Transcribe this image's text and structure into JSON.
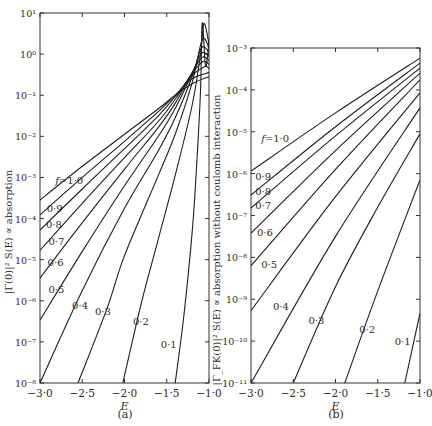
{
  "figure": {
    "caption_a": "(a)",
    "caption_b": "(b)"
  },
  "chart_data": [
    {
      "type": "line",
      "panel": "(a)",
      "title": "",
      "xlabel": "E",
      "ylabel": "|Γ(0)|² S(E) ∝ absorption",
      "yscale": "log",
      "xlim": [
        -3.0,
        -1.0
      ],
      "ylim_log10": [
        -8,
        1
      ],
      "xticks": [
        "−3·0",
        "−2·5",
        "−2·0",
        "−1·5",
        "−1·0"
      ],
      "xtick_values": [
        -3.0,
        -2.5,
        -2.0,
        -1.5,
        -1.0
      ],
      "yticks": [
        "10⁻⁸",
        "10⁻⁷",
        "10⁻⁶",
        "10⁻⁵",
        "10⁻⁴",
        "10⁻³",
        "10⁻²",
        "10⁻¹",
        "10⁰",
        "10¹"
      ],
      "ytick_exponents": [
        -8,
        -7,
        -6,
        -5,
        -4,
        -3,
        -2,
        -1,
        0,
        1
      ],
      "grid": false,
      "legend": "inline labels",
      "series": [
        {
          "name": "f=1·0",
          "label": "f=1·0",
          "points_log10": [
            [
              -3.0,
              -3.55
            ],
            [
              -2.5,
              -2.73
            ],
            [
              -2.0,
              -1.95
            ],
            [
              -1.6,
              -1.33
            ],
            [
              -1.4,
              -1.0
            ],
            [
              -1.2,
              -0.72
            ],
            [
              -1.0,
              -0.55
            ]
          ],
          "label_pos": [
            -2.82,
            -3.15
          ]
        },
        {
          "name": "f=0·9",
          "label": "0·9",
          "points_log10": [
            [
              -3.0,
              -3.91
            ],
            [
              -2.5,
              -3.0
            ],
            [
              -2.0,
              -2.12
            ],
            [
              -1.6,
              -1.4
            ],
            [
              -1.4,
              -1.0
            ],
            [
              -1.2,
              -0.6
            ],
            [
              -1.0,
              -0.45
            ]
          ],
          "label_pos": [
            -2.92,
            -3.85
          ]
        },
        {
          "name": "f=0·8",
          "label": "0·8",
          "points_log10": [
            [
              -3.0,
              -4.28
            ],
            [
              -2.5,
              -3.28
            ],
            [
              -2.0,
              -2.3
            ],
            [
              -1.6,
              -1.5
            ],
            [
              -1.4,
              -1.03
            ],
            [
              -1.2,
              -0.52
            ],
            [
              -1.05,
              -0.3
            ],
            [
              -1.0,
              -0.35
            ]
          ],
          "label_pos": [
            -2.93,
            -4.22
          ]
        },
        {
          "name": "f=0·7",
          "label": "0·7",
          "points_log10": [
            [
              -3.0,
              -4.77
            ],
            [
              -2.5,
              -3.63
            ],
            [
              -2.0,
              -2.52
            ],
            [
              -1.6,
              -1.64
            ],
            [
              -1.4,
              -1.1
            ],
            [
              -1.2,
              -0.47
            ],
            [
              -1.07,
              -0.18
            ],
            [
              -1.0,
              -0.25
            ]
          ],
          "label_pos": [
            -2.9,
            -4.65
          ]
        },
        {
          "name": "f=0·6",
          "label": "0·6",
          "points_log10": [
            [
              -3.0,
              -5.45
            ],
            [
              -2.5,
              -4.1
            ],
            [
              -2.0,
              -2.8
            ],
            [
              -1.6,
              -1.78
            ],
            [
              -1.4,
              -1.2
            ],
            [
              -1.2,
              -0.45
            ],
            [
              -1.08,
              -0.08
            ],
            [
              -1.0,
              -0.15
            ]
          ],
          "label_pos": [
            -2.91,
            -5.15
          ]
        },
        {
          "name": "f=0·5",
          "label": "0·5",
          "points_log10": [
            [
              -3.0,
              -6.47
            ],
            [
              -2.5,
              -4.8
            ],
            [
              -2.0,
              -3.2
            ],
            [
              -1.6,
              -2.0
            ],
            [
              -1.4,
              -1.32
            ],
            [
              -1.2,
              -0.48
            ],
            [
              -1.09,
              0.02
            ],
            [
              -1.0,
              -0.05
            ]
          ],
          "label_pos": [
            -2.9,
            -5.8
          ]
        },
        {
          "name": "f=0·4",
          "label": "0·4",
          "points_log10": [
            [
              -3.0,
              -8.0
            ],
            [
              -2.5,
              -5.75
            ],
            [
              -2.0,
              -3.75
            ],
            [
              -1.6,
              -2.35
            ],
            [
              -1.4,
              -1.55
            ],
            [
              -1.2,
              -0.55
            ],
            [
              -1.09,
              0.15
            ],
            [
              -1.0,
              0.05
            ]
          ],
          "label_pos": [
            -2.62,
            -6.2
          ]
        },
        {
          "name": "f=0·3",
          "label": "0·3",
          "points_log10": [
            [
              -2.55,
              -8.0
            ],
            [
              -2.2,
              -6.15
            ],
            [
              -2.0,
              -4.9
            ],
            [
              -1.6,
              -2.95
            ],
            [
              -1.4,
              -1.95
            ],
            [
              -1.2,
              -0.7
            ],
            [
              -1.08,
              0.35
            ],
            [
              -1.0,
              0.15
            ]
          ],
          "label_pos": [
            -2.35,
            -6.35
          ]
        },
        {
          "name": "f=0·2",
          "label": "0·2",
          "points_log10": [
            [
              -2.02,
              -8.0
            ],
            [
              -1.8,
              -6.05
            ],
            [
              -1.6,
              -4.5
            ],
            [
              -1.4,
              -2.95
            ],
            [
              -1.2,
              -1.25
            ],
            [
              -1.1,
              0.0
            ],
            [
              -1.06,
              0.75
            ],
            [
              -1.0,
              0.25
            ]
          ],
          "label_pos": [
            -1.9,
            -6.6
          ]
        },
        {
          "name": "f=0·1",
          "label": "0·1",
          "points_log10": [
            [
              -1.4,
              -8.0
            ],
            [
              -1.3,
              -6.4
            ],
            [
              -1.2,
              -4.35
            ],
            [
              -1.15,
              -2.85
            ],
            [
              -1.1,
              -0.9
            ],
            [
              -1.08,
              0.76
            ],
            [
              -1.04,
              -0.3
            ],
            [
              -1.0,
              0.3
            ]
          ],
          "label_pos": [
            -1.57,
            -7.15
          ]
        }
      ]
    },
    {
      "type": "line",
      "panel": "(b)",
      "title": "",
      "xlabel": "E",
      "ylabel": "|Γ_FK(0)|² S(E) ∝ absorption without coulomb interaction",
      "yscale": "log",
      "xlim": [
        -3.0,
        -1.0
      ],
      "ylim_log10": [
        -11,
        -3
      ],
      "xticks": [
        "−3·0",
        "−2·5",
        "−2·0",
        "−1·5",
        "−1·0"
      ],
      "xtick_values": [
        -3.0,
        -2.5,
        -2.0,
        -1.5,
        -1.0
      ],
      "yticks": [
        "10⁻¹¹",
        "10⁻¹⁰",
        "10⁻⁹",
        "10⁻⁸",
        "10⁻⁷",
        "10⁻⁶",
        "10⁻⁵",
        "10⁻⁴",
        "10⁻³"
      ],
      "ytick_exponents": [
        -11,
        -10,
        -9,
        -8,
        -7,
        -6,
        -5,
        -4,
        -3
      ],
      "grid": false,
      "legend": "inline labels",
      "series": [
        {
          "name": "f=1·0",
          "label": "f=1·0",
          "points_log10": [
            [
              -3.0,
              -5.94
            ],
            [
              -2.0,
              -4.55
            ],
            [
              -1.0,
              -3.24
            ]
          ],
          "label_pos": [
            -2.88,
            -5.25
          ]
        },
        {
          "name": "f=0·9",
          "label": "0·9",
          "points_log10": [
            [
              -3.0,
              -6.51
            ],
            [
              -2.0,
              -4.88
            ],
            [
              -1.0,
              -3.36
            ]
          ],
          "label_pos": [
            -2.95,
            -6.15
          ]
        },
        {
          "name": "f=0·8",
          "label": "0·8",
          "points_log10": [
            [
              -3.0,
              -6.82
            ],
            [
              -2.0,
              -5.1
            ],
            [
              -1.0,
              -3.48
            ]
          ],
          "label_pos": [
            -2.95,
            -6.5
          ]
        },
        {
          "name": "f=0·7",
          "label": "0·7",
          "points_log10": [
            [
              -3.0,
              -7.42
            ],
            [
              -2.0,
              -5.45
            ],
            [
              -1.0,
              -3.6
            ]
          ],
          "label_pos": [
            -2.95,
            -6.85
          ]
        },
        {
          "name": "f=0·6",
          "label": "0·6",
          "points_log10": [
            [
              -3.0,
              -8.2
            ],
            [
              -2.0,
              -5.9
            ],
            [
              -1.0,
              -3.76
            ]
          ],
          "label_pos": [
            -2.93,
            -7.5
          ]
        },
        {
          "name": "f=0·5",
          "label": "0·5",
          "points_log10": [
            [
              -3.0,
              -9.27
            ],
            [
              -2.0,
              -6.55
            ],
            [
              -1.0,
              -4.07
            ]
          ],
          "label_pos": [
            -2.88,
            -8.25
          ]
        },
        {
          "name": "f=0·4",
          "label": "0·4",
          "points_log10": [
            [
              -3.0,
              -11.0
            ],
            [
              -2.0,
              -7.5
            ],
            [
              -1.0,
              -4.43
            ]
          ],
          "label_pos": [
            -2.74,
            -9.25
          ]
        },
        {
          "name": "f=0·3",
          "label": "0·3",
          "points_log10": [
            [
              -2.5,
              -11.0
            ],
            [
              -2.0,
              -8.7
            ],
            [
              -1.5,
              -6.8
            ],
            [
              -1.0,
              -5.05
            ]
          ],
          "label_pos": [
            -2.32,
            -9.6
          ]
        },
        {
          "name": "f=0·2",
          "label": "0·2",
          "points_log10": [
            [
              -1.89,
              -11.0
            ],
            [
              -1.5,
              -8.8
            ],
            [
              -1.0,
              -6.15
            ]
          ],
          "label_pos": [
            -1.72,
            -9.8
          ]
        },
        {
          "name": "f=0·1",
          "label": "0·1",
          "points_log10": [
            [
              -1.18,
              -11.0
            ],
            [
              -1.0,
              -9.33
            ]
          ],
          "label_pos": [
            -1.3,
            -10.1
          ]
        }
      ]
    }
  ]
}
